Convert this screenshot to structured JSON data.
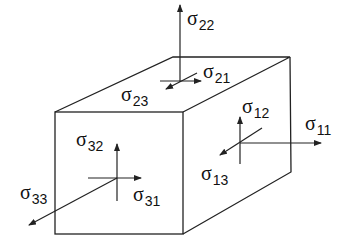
{
  "diagram": {
    "title": "",
    "colors": {
      "stroke": "#222222",
      "background": "#ffffff"
    },
    "labels": [
      {
        "id": "s22",
        "symbol": "σ",
        "sub": "22",
        "x": 187,
        "y": 8
      },
      {
        "id": "s21",
        "symbol": "σ",
        "sub": "21",
        "x": 203,
        "y": 61
      },
      {
        "id": "s23",
        "symbol": "σ",
        "sub": "23",
        "x": 121,
        "y": 84
      },
      {
        "id": "s12",
        "symbol": "σ",
        "sub": "12",
        "x": 242,
        "y": 96
      },
      {
        "id": "s11",
        "symbol": "σ",
        "sub": "11",
        "x": 305,
        "y": 113
      },
      {
        "id": "s13",
        "symbol": "σ",
        "sub": "13",
        "x": 201,
        "y": 163
      },
      {
        "id": "s32",
        "symbol": "σ",
        "sub": "32",
        "x": 76,
        "y": 129
      },
      {
        "id": "s31",
        "symbol": "σ",
        "sub": "31",
        "x": 133,
        "y": 184
      },
      {
        "id": "s33",
        "symbol": "σ",
        "sub": "33",
        "x": 20,
        "y": 182
      }
    ]
  }
}
